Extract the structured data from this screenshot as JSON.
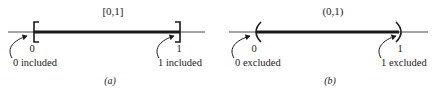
{
  "panels": [
    {
      "id": "a",
      "interval_label": "[0,1]",
      "left_endpoint": "0",
      "right_endpoint": "1",
      "left_note": "0 included",
      "right_note": "1 included",
      "caption": "(a)",
      "left_marker": "closed-bracket",
      "right_marker": "closed-bracket"
    },
    {
      "id": "b",
      "interval_label": "(0,1)",
      "left_endpoint": "0",
      "right_endpoint": "1",
      "left_note": "0 excluded",
      "right_note": "1 excluded",
      "caption": "(b)",
      "left_marker": "open-parenthesis",
      "right_marker": "open-parenthesis"
    }
  ],
  "colors": {
    "ink": "#1a1a1a",
    "axis": "#333333",
    "background": "#ffffff"
  }
}
